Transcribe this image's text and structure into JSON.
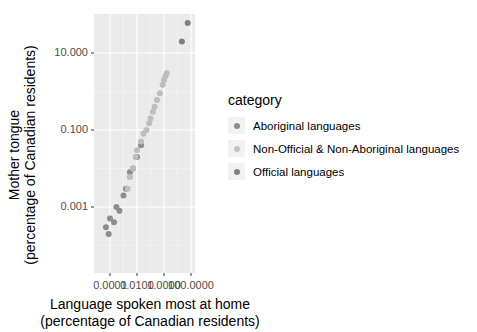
{
  "chart_data": {
    "type": "scatter",
    "title": "",
    "xlabel": "Language spoken most at home\n(percentage of Canadian residents)",
    "ylabel": "Mother tongue\n(percentage of Canadian residents)",
    "x_scale": "log10",
    "y_scale": "log10",
    "x_tick_labels": [
      "0.0001",
      "0.0100",
      "1.0000",
      "100.0000"
    ],
    "y_tick_labels": [
      "10.000",
      "0.100",
      "0.001"
    ],
    "legend_title": "category",
    "legend_position": "right",
    "grid": true,
    "series": [
      {
        "name": "Aboriginal languages",
        "color": "#8c8c8c",
        "points": [
          [
            5e-05,
            0.0003
          ],
          [
            8e-05,
            0.0002
          ],
          [
            0.0001,
            0.0005
          ],
          [
            0.0002,
            0.0004
          ],
          [
            0.0003,
            0.001
          ],
          [
            0.0005,
            0.0008
          ],
          [
            0.001,
            0.002
          ],
          [
            0.0015,
            0.003
          ],
          [
            0.003,
            0.008
          ],
          [
            0.005,
            0.01
          ],
          [
            0.01,
            0.02
          ],
          [
            0.02,
            0.04
          ]
        ]
      },
      {
        "name": "Non-Official & Non-Aboriginal languages",
        "color": "#bdbdbd",
        "points": [
          [
            0.002,
            0.003
          ],
          [
            0.003,
            0.006
          ],
          [
            0.005,
            0.01
          ],
          [
            0.008,
            0.02
          ],
          [
            0.01,
            0.03
          ],
          [
            0.02,
            0.05
          ],
          [
            0.03,
            0.08
          ],
          [
            0.05,
            0.1
          ],
          [
            0.08,
            0.15
          ],
          [
            0.1,
            0.2
          ],
          [
            0.15,
            0.3
          ],
          [
            0.2,
            0.4
          ],
          [
            0.3,
            0.6
          ],
          [
            0.5,
            0.9
          ],
          [
            0.8,
            1.5
          ],
          [
            1.0,
            2.0
          ],
          [
            1.3,
            2.5
          ],
          [
            1.6,
            3.0
          ]
        ]
      },
      {
        "name": "Official languages",
        "color": "#808080",
        "points": [
          [
            21,
            20
          ],
          [
            57,
            60
          ]
        ]
      }
    ]
  },
  "axes": {
    "y_ticks": [
      {
        "label": "10.000",
        "y": 53
      },
      {
        "label": "0.100",
        "y": 130
      },
      {
        "label": "0.001",
        "y": 207
      }
    ],
    "x_ticks": [
      {
        "label": "0.0001",
        "x": 110
      },
      {
        "label": "0.0100",
        "x": 137
      },
      {
        "label": "1.0000",
        "x": 164
      },
      {
        "label": "100.0000",
        "x": 191
      }
    ],
    "xlabel_line1": "Language spoken most at home",
    "xlabel_line2": "(percentage of Canadian residents)",
    "ylabel_line1": "Mother tongue",
    "ylabel_line2": "(percentage of Canadian residents)"
  },
  "legend": {
    "title": "category",
    "items": [
      {
        "label": "Aboriginal languages",
        "color": "#8c8c8c"
      },
      {
        "label": "Non-Official & Non-Aboriginal languages",
        "color": "#c2c2c2"
      },
      {
        "label": "Official languages",
        "color": "#808080"
      }
    ]
  }
}
